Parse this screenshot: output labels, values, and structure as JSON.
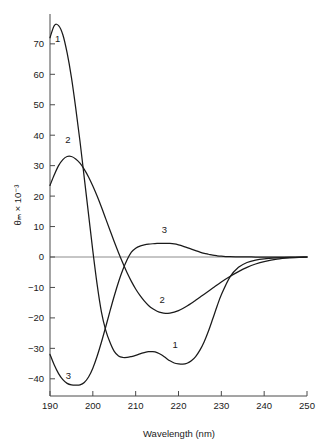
{
  "chart_data": {
    "type": "line",
    "title": "",
    "xlabel": "Wavelength (nm)",
    "ylabel": "θₘ × 10⁻³",
    "xlim": [
      190,
      250
    ],
    "ylim": [
      -45,
      78
    ],
    "grid": false,
    "legend_position": "inline-curve-labels",
    "xticks": [
      190,
      200,
      210,
      220,
      230,
      240,
      250
    ],
    "xtick_labels": [
      "190",
      "200",
      "210",
      "220",
      "230",
      "240",
      "250"
    ],
    "yticks": [
      -40,
      -30,
      -20,
      -10,
      0,
      10,
      20,
      30,
      40,
      50,
      60,
      70
    ],
    "ytick_labels": [
      "−40",
      "−30",
      "−20",
      "−10",
      "0",
      "10",
      "20",
      "30",
      "40",
      "50",
      "60",
      "70"
    ],
    "zero_line": 0,
    "series": [
      {
        "name": "1",
        "label": "1",
        "x": [
          190,
          191,
          192,
          193,
          194,
          195,
          196,
          197,
          198,
          199,
          200,
          201,
          202,
          203,
          204,
          205,
          206,
          207,
          208,
          209,
          210,
          211,
          212,
          213,
          214,
          215,
          216,
          217,
          218,
          219,
          220,
          221,
          222,
          223,
          224,
          225,
          226,
          227,
          228,
          229,
          230,
          232,
          234,
          236,
          238,
          240,
          243,
          246,
          250
        ],
        "y": [
          72,
          76,
          76,
          73,
          67,
          59,
          49,
          38,
          26,
          14,
          2,
          -9,
          -18,
          -24,
          -28,
          -31,
          -32.5,
          -33,
          -33,
          -32.7,
          -32.3,
          -31.8,
          -31.4,
          -31.1,
          -31.1,
          -31.4,
          -32.1,
          -33.1,
          -34.1,
          -34.8,
          -35.1,
          -35.2,
          -34.9,
          -34.1,
          -32.7,
          -30.6,
          -27.8,
          -24.3,
          -20.3,
          -16.2,
          -12.4,
          -6.6,
          -3.4,
          -1.8,
          -1.0,
          -0.6,
          -0.3,
          -0.1,
          0
        ]
      },
      {
        "name": "2",
        "label": "2",
        "x": [
          190,
          191,
          192,
          193,
          194,
          195,
          196,
          197,
          198,
          199,
          200,
          201,
          202,
          203,
          204,
          205,
          206,
          207,
          208,
          209,
          210,
          211,
          212,
          213,
          214,
          215,
          216,
          217,
          218,
          219,
          220,
          221,
          222,
          223,
          224,
          225,
          226,
          228,
          230,
          232,
          234,
          236,
          238,
          240,
          243,
          246,
          250
        ],
        "y": [
          23.5,
          27,
          30,
          32,
          33,
          33,
          32.2,
          30.8,
          28.8,
          26.3,
          23.3,
          20,
          16.4,
          12.6,
          8.8,
          5,
          1.4,
          -2,
          -5.2,
          -8,
          -10.5,
          -12.6,
          -14.4,
          -15.9,
          -17,
          -17.8,
          -18.3,
          -18.5,
          -18.4,
          -18.1,
          -17.6,
          -16.9,
          -16.1,
          -15.2,
          -14.2,
          -13.2,
          -12.2,
          -10.2,
          -8.2,
          -6.4,
          -4.8,
          -3.4,
          -2.3,
          -1.5,
          -0.7,
          -0.3,
          0
        ]
      },
      {
        "name": "3",
        "label": "3",
        "x": [
          190,
          191,
          192,
          193,
          194,
          195,
          196,
          197,
          198,
          199,
          200,
          201,
          202,
          203,
          204,
          205,
          206,
          207,
          208,
          209,
          210,
          211,
          212,
          213,
          214,
          215,
          216,
          217,
          218,
          219,
          220,
          221,
          222,
          223,
          224,
          225,
          226,
          227,
          228,
          229,
          230,
          231,
          232,
          234,
          236,
          238,
          240,
          243,
          246,
          250
        ],
        "y": [
          -32,
          -35.5,
          -38.3,
          -40.3,
          -41.5,
          -42,
          -42.1,
          -42,
          -41.2,
          -39.4,
          -36.5,
          -32.6,
          -28,
          -23,
          -17.8,
          -12.8,
          -8.2,
          -4.2,
          -0.9,
          1.6,
          2.9,
          3.6,
          3.95,
          4.2,
          4.35,
          4.45,
          4.5,
          4.5,
          4.45,
          4.3,
          4.0,
          3.6,
          3.1,
          2.6,
          2.1,
          1.6,
          1.2,
          0.9,
          0.6,
          0.4,
          0.25,
          0.15,
          0.1,
          0.05,
          0.02,
          0.0,
          0.0,
          0.0,
          0.0,
          0.0
        ]
      }
    ],
    "annotations": [
      {
        "text": "1",
        "x": 191.8,
        "y": 70.5,
        "series": "1"
      },
      {
        "text": "2",
        "x": 194.2,
        "y": 37.5,
        "series": "2"
      },
      {
        "text": "3",
        "x": 216.7,
        "y": 8.0,
        "series": "3"
      },
      {
        "text": "2",
        "x": 216.2,
        "y": -15.0,
        "series": "2"
      },
      {
        "text": "1",
        "x": 219.2,
        "y": -30.0,
        "series": "1"
      },
      {
        "text": "3",
        "x": 194.3,
        "y": -40.0,
        "series": "3"
      }
    ]
  },
  "colors": {
    "background": "#ffffff",
    "curve": "#1a1a1a",
    "axis": "#4a4a4a",
    "zero_line": "#8c8c8c",
    "text": "#1a1a1a"
  }
}
